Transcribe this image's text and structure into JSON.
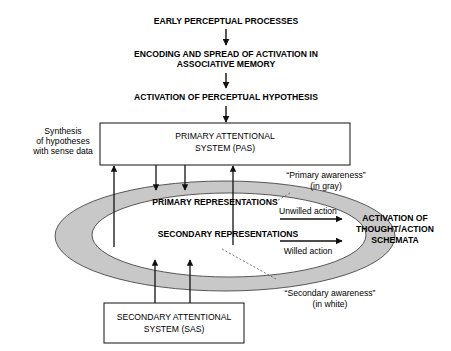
{
  "flow": {
    "step1": "EARLY PERCEPTUAL PROCESSES",
    "step2_line1": "ENCODING AND SPREAD OF ACTIVATION IN",
    "step2_line2": "ASSOCIATIVE MEMORY",
    "step3": "ACTIVATION OF PERCEPTUAL HYPOTHESIS"
  },
  "pas": {
    "line1": "PRIMARY ATTENTIONAL",
    "line2": "SYSTEM (PAS)"
  },
  "sas": {
    "line1": "SECONDARY ATTENTIONAL",
    "line2": "SYSTEM (SAS)"
  },
  "synthesis": {
    "line1": "Synthesis",
    "line2": "of hypotheses",
    "line3": "with sense data"
  },
  "ring": {
    "primary_label": "PRIMARY REPRESENTATIONS",
    "secondary_label": "SECONDARY REPRESENTATIONS",
    "ring_color": "#c8c8c8",
    "inner_color": "#ffffff"
  },
  "primary_awareness": {
    "line1": "“Primary awareness”",
    "line2": "(in gray)"
  },
  "secondary_awareness": {
    "line1": "“Secondary awareness”",
    "line2": "(in white)"
  },
  "actions": {
    "unwilled": "Unwilled action",
    "willed": "Willed action"
  },
  "output": {
    "line1": "ACTIVATION OF",
    "line2": "THOUGHT/ACTION",
    "line3": "SCHEMATA"
  }
}
